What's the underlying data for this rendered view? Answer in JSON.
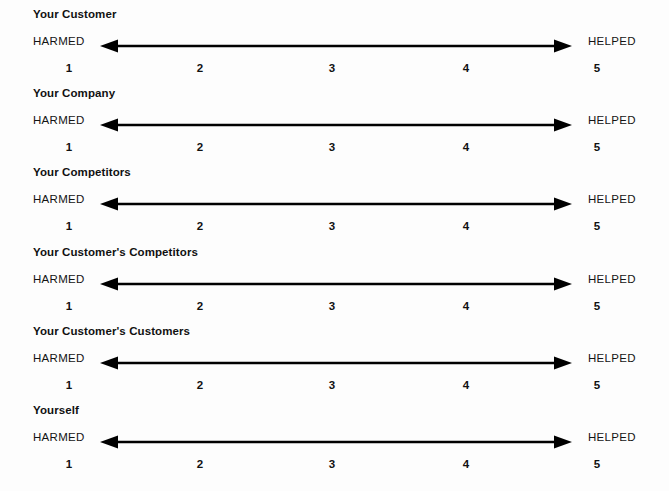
{
  "worksheet": {
    "background_color": "#fdfdfd",
    "ink_color": "#000000",
    "anchor_left_label": "HARMED",
    "anchor_right_label": "HELPED",
    "scale_points": [
      "1",
      "2",
      "3",
      "4",
      "5"
    ],
    "rows": [
      {
        "heading": "Your Customer"
      },
      {
        "heading": "Your Company"
      },
      {
        "heading": "Your Competitors"
      },
      {
        "heading": "Your Customer's Competitors"
      },
      {
        "heading": "Your Customer's Customers"
      },
      {
        "heading": "Yourself"
      }
    ]
  }
}
